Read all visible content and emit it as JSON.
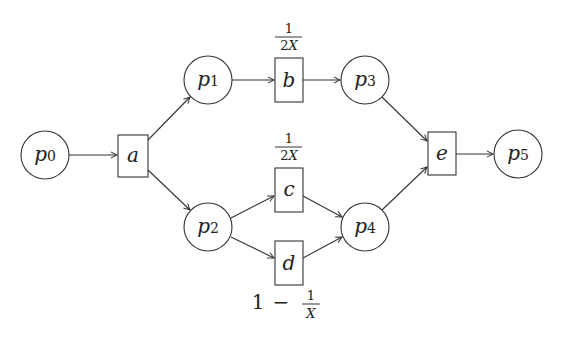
{
  "diagram": {
    "type": "petri-net",
    "places": [
      {
        "id": "p0",
        "base": "p",
        "sub": "0",
        "cx": 45,
        "cy": 155
      },
      {
        "id": "p1",
        "base": "p",
        "sub": "1",
        "cx": 208,
        "cy": 80
      },
      {
        "id": "p2",
        "base": "p",
        "sub": "2",
        "cx": 208,
        "cy": 227
      },
      {
        "id": "p3",
        "base": "p",
        "sub": "3",
        "cx": 365,
        "cy": 80
      },
      {
        "id": "p4",
        "base": "p",
        "sub": "4",
        "cx": 365,
        "cy": 227
      },
      {
        "id": "p5",
        "base": "p",
        "sub": "5",
        "cx": 518,
        "cy": 154
      }
    ],
    "transitions": [
      {
        "id": "a",
        "label": "a",
        "x": 118,
        "y": 135,
        "w": 30,
        "h": 42
      },
      {
        "id": "b",
        "label": "b",
        "x": 275,
        "y": 58,
        "w": 28,
        "h": 44,
        "rate": {
          "num": "1",
          "den_num": "2",
          "den_var": "X"
        }
      },
      {
        "id": "c",
        "label": "c",
        "x": 275,
        "y": 168,
        "w": 28,
        "h": 44,
        "rate": {
          "num": "1",
          "den_num": "2",
          "den_var": "X"
        }
      },
      {
        "id": "d",
        "label": "d",
        "x": 275,
        "y": 241,
        "w": 28,
        "h": 44,
        "rate_text": {
          "prefix": "1 − ",
          "num": "1",
          "den_var": "X"
        }
      },
      {
        "id": "e",
        "label": "e",
        "x": 428,
        "y": 132,
        "w": 28,
        "h": 43
      }
    ],
    "arcs": [
      {
        "from": "p0",
        "to": "a"
      },
      {
        "from": "a",
        "to": "p1"
      },
      {
        "from": "a",
        "to": "p2"
      },
      {
        "from": "p1",
        "to": "b"
      },
      {
        "from": "b",
        "to": "p3"
      },
      {
        "from": "p2",
        "to": "c"
      },
      {
        "from": "p2",
        "to": "d"
      },
      {
        "from": "c",
        "to": "p4"
      },
      {
        "from": "d",
        "to": "p4"
      },
      {
        "from": "p3",
        "to": "e"
      },
      {
        "from": "p4",
        "to": "e"
      },
      {
        "from": "e",
        "to": "p5"
      }
    ],
    "labels": {
      "p0": {
        "base": "p",
        "sub": "0"
      },
      "p1": {
        "base": "p",
        "sub": "1"
      },
      "p2": {
        "base": "p",
        "sub": "2"
      },
      "p3": {
        "base": "p",
        "sub": "3"
      },
      "p4": {
        "base": "p",
        "sub": "4"
      },
      "p5": {
        "base": "p",
        "sub": "5"
      },
      "a": "a",
      "b": "b",
      "c": "c",
      "d": "d",
      "e": "e",
      "rate_b": {
        "num": "1",
        "den": "2",
        "var": "X"
      },
      "rate_c": {
        "num": "1",
        "den": "2",
        "var": "X"
      },
      "rate_d": {
        "one": "1",
        "minus": "−",
        "num": "1",
        "var": "X"
      }
    },
    "colors": {
      "stroke": "#333333",
      "text": "#222222",
      "background": "#ffffff"
    }
  }
}
